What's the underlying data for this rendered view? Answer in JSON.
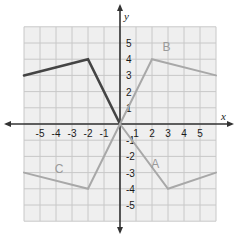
{
  "chart_data": {
    "type": "line",
    "title": "",
    "xlabel": "x",
    "ylabel": "y",
    "xlim": [
      -6,
      6
    ],
    "ylim": [
      -6,
      6
    ],
    "grid": true,
    "x_ticks": [
      "-5",
      "-4",
      "-3",
      "-2",
      "-1",
      "1",
      "2",
      "3",
      "4",
      "5"
    ],
    "y_ticks": [
      "5",
      "4",
      "3",
      "2",
      "1",
      "-1",
      "-2",
      "-3",
      "-4",
      "-5"
    ],
    "series": [
      {
        "name": "original",
        "label": "",
        "color": "#444444",
        "points": [
          [
            -6,
            3
          ],
          [
            -2,
            4
          ],
          [
            0,
            0
          ]
        ]
      },
      {
        "name": "B",
        "label": "B",
        "color": "#a8a8a8",
        "points": [
          [
            0,
            0
          ],
          [
            2,
            4
          ],
          [
            6,
            3
          ]
        ]
      },
      {
        "name": "A",
        "label": "A",
        "color": "#a8a8a8",
        "points": [
          [
            0,
            0
          ],
          [
            3,
            -4
          ],
          [
            6,
            -3
          ]
        ]
      },
      {
        "name": "C",
        "label": "C",
        "color": "#a8a8a8",
        "points": [
          [
            -6,
            -3
          ],
          [
            -2,
            -4
          ],
          [
            0,
            0
          ]
        ]
      }
    ],
    "colors": {
      "grid": "#c8c8c8",
      "grid_bg": "#efefef",
      "axis": "#333333"
    }
  }
}
